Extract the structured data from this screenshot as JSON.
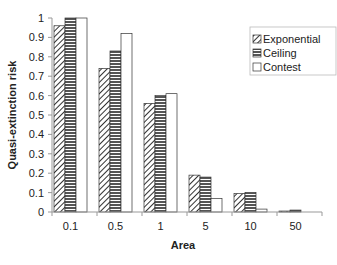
{
  "chart_data": {
    "type": "bar",
    "title": "",
    "xlabel": "Area",
    "ylabel": "Quasi-extinction risk",
    "categories": [
      "0.1",
      "0.5",
      "1",
      "5",
      "10",
      "50"
    ],
    "series": [
      {
        "name": "Exponential",
        "pattern": "diagonal-hatch",
        "values": [
          0.96,
          0.74,
          0.56,
          0.19,
          0.095,
          0.005
        ]
      },
      {
        "name": "Ceiling",
        "pattern": "horizontal-stripes",
        "values": [
          1.0,
          0.83,
          0.6,
          0.18,
          0.1,
          0.01
        ]
      },
      {
        "name": "Contest",
        "pattern": "white",
        "values": [
          1.0,
          0.92,
          0.61,
          0.07,
          0.015,
          0.0
        ]
      }
    ],
    "ylim": [
      0,
      1
    ],
    "yticks": [
      "0",
      "0.1",
      "0.2",
      "0.3",
      "0.4",
      "0.5",
      "0.6",
      "0.7",
      "0.8",
      "0.9",
      "1"
    ],
    "grid": false,
    "legend_position": "upper-right"
  },
  "colors": {
    "axis": "#999999",
    "bar_border": "#333333",
    "hatch": "#333333",
    "stripe": "#444444",
    "fill_white": "#ffffff"
  }
}
